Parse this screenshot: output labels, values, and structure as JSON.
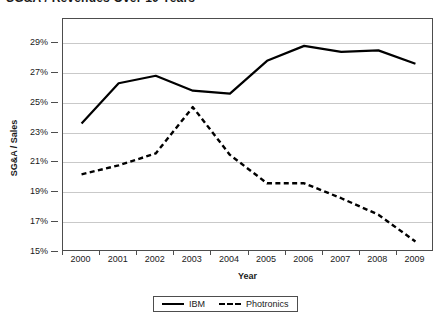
{
  "chart_data": {
    "type": "line",
    "title": "SG&A / Revenues Over 10 Years",
    "xlabel": "Year",
    "ylabel": "SG&A / Sales",
    "categories": [
      "2000",
      "2001",
      "2002",
      "2003",
      "2004",
      "2005",
      "2006",
      "2007",
      "2008",
      "2009"
    ],
    "ytick_labels": [
      "29%",
      "27%",
      "25%",
      "23%",
      "21%",
      "19%",
      "17%",
      "15%"
    ],
    "ytick_values": [
      29,
      27,
      25,
      23,
      21,
      19,
      17,
      15
    ],
    "ylim": [
      15,
      30.6
    ],
    "grid": true,
    "legend_position": "bottom-center",
    "series": [
      {
        "name": "IBM",
        "style": "solid",
        "color": "#000000",
        "values": [
          23.6,
          26.3,
          26.8,
          25.8,
          25.6,
          27.8,
          28.8,
          28.4,
          28.5,
          27.6
        ]
      },
      {
        "name": "Photronics",
        "style": "dashed",
        "color": "#000000",
        "values": [
          20.2,
          20.8,
          21.6,
          24.7,
          21.5,
          19.6,
          19.6,
          18.6,
          17.5,
          15.7
        ]
      }
    ]
  },
  "axes": {
    "y_title": "SG&A / Sales",
    "x_title": "Year"
  },
  "legend": {
    "items": [
      {
        "label": "IBM",
        "style": "solid"
      },
      {
        "label": "Photronics",
        "style": "dashed"
      }
    ]
  }
}
